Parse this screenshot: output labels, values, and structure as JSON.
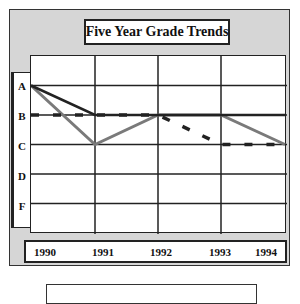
{
  "chart_data": {
    "type": "line",
    "title": "Five Year Grade Trends",
    "xlabel": "",
    "ylabel": "",
    "categories": [
      "1990",
      "1991",
      "1992",
      "1993",
      "1994"
    ],
    "y_ticks": [
      "A",
      "B",
      "C",
      "D",
      "F"
    ],
    "y_scale_note": "grade points: A=4, B=3, C=2, D=1, F=0",
    "ylim": [
      "F",
      "above A"
    ],
    "grid": true,
    "legend_position": "bottom (empty box)",
    "series": [
      {
        "name": "Series 1 (solid black)",
        "style": "solid",
        "color": "#222222",
        "values": [
          "A",
          "B",
          "B",
          "B",
          "B"
        ],
        "numeric": [
          4,
          3,
          3,
          3,
          3
        ]
      },
      {
        "name": "Series 2 (thick gray)",
        "style": "solid-thick",
        "color": "#7a7a7a",
        "values": [
          "A",
          "C",
          "B",
          "B",
          "C"
        ],
        "numeric": [
          4,
          2,
          3,
          3,
          2
        ]
      },
      {
        "name": "Series 3 (dashed black)",
        "style": "dashed",
        "color": "#222222",
        "values": [
          "B",
          "B",
          "B",
          "C",
          "C"
        ],
        "numeric": [
          3,
          3,
          3,
          2,
          2
        ]
      }
    ]
  },
  "title": "Five Year Grade Trends",
  "y_axis": {
    "labels": [
      "A",
      "B",
      "C",
      "D",
      "F"
    ]
  },
  "x_axis": {
    "labels": [
      "1990",
      "1991",
      "1992",
      "1993",
      "1994"
    ]
  },
  "colors": {
    "frame_border": "#333333",
    "frame_fill": "#d6d6d6",
    "line_dark": "#222222",
    "line_gray": "#7a7a7a"
  }
}
